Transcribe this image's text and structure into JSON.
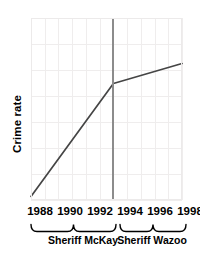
{
  "chart_data": {
    "type": "line",
    "title": "",
    "subtitle": "",
    "xlabel": "",
    "ylabel": "Crime rate",
    "xlim": [
      1988,
      1999
    ],
    "ylim": [
      0,
      100
    ],
    "grid": true,
    "legend": false,
    "x_tick_labels": [
      "1988",
      "1990",
      "1992",
      "1994",
      "1996",
      "1998"
    ],
    "x_tick_values": [
      1988,
      1990,
      1992,
      1994,
      1996,
      1998
    ],
    "y_tick_labels": [],
    "series": [
      {
        "name": "Crime rate",
        "color": "#454545",
        "x": [
          1988,
          1994,
          1999
        ],
        "values": [
          2,
          64,
          75
        ]
      }
    ],
    "annotations": {
      "divider": {
        "name": "sheriff-transition-line",
        "x": 1994,
        "color": "#8c8c8c"
      },
      "groups": [
        {
          "label": "Sheriff McKay",
          "x_start": 1988,
          "x_end": 1994
        },
        {
          "label": "Sheriff Wazoo",
          "x_start": 1994,
          "x_end": 1999
        }
      ]
    }
  },
  "axes": {
    "y_title": "Crime rate"
  },
  "ticks": [
    {
      "label": "1988",
      "x_px": 40
    },
    {
      "label": "1990",
      "x_px": 70
    },
    {
      "label": "1992",
      "x_px": 100
    },
    {
      "label": "1994",
      "x_px": 130
    },
    {
      "label": "1996",
      "x_px": 160
    },
    {
      "label": "1998",
      "x_px": 190
    }
  ],
  "groups": [
    {
      "label": "Sheriff McKay",
      "center_px": 83,
      "left_px": 31,
      "right_px": 116
    },
    {
      "label": "Sheriff Wazoo",
      "center_px": 152,
      "left_px": 120,
      "right_px": 186
    }
  ],
  "colors": {
    "line": "#454545",
    "divider": "#8c8c8c",
    "grid": "#efeded",
    "panel_border": "#eceaea",
    "text": "#000000",
    "background": "#ffffff"
  }
}
